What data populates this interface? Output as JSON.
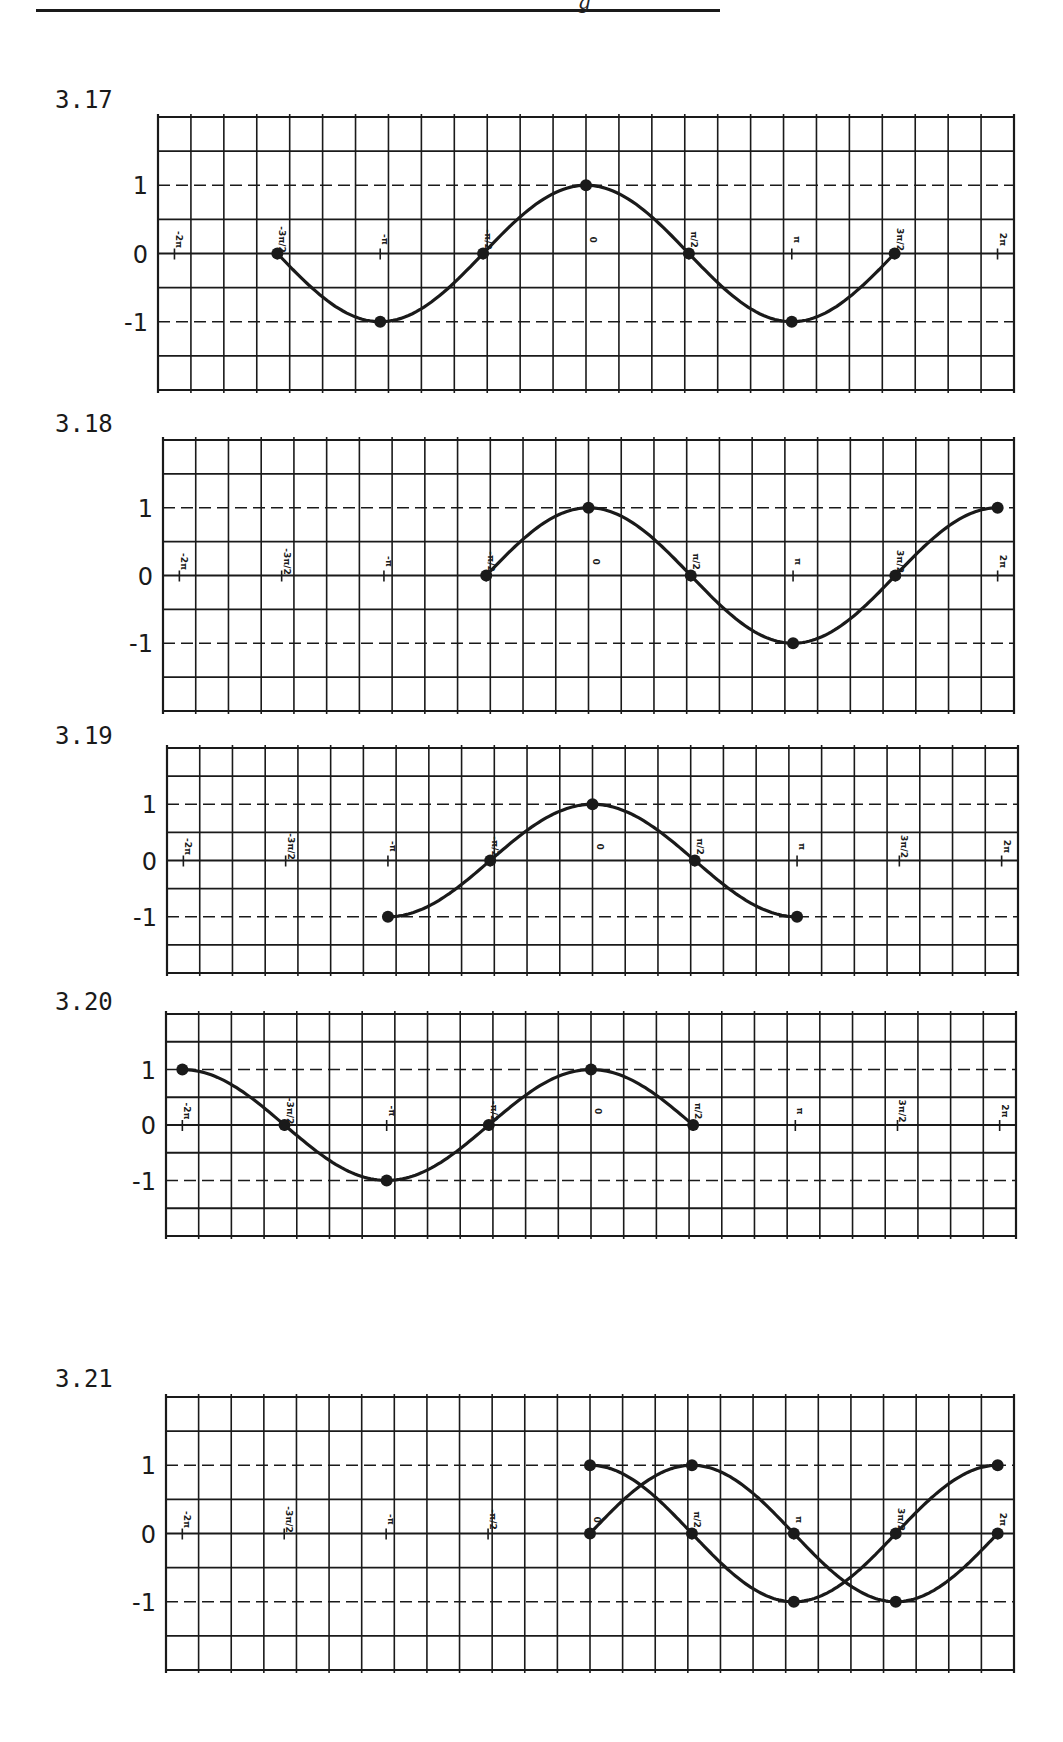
{
  "header": {
    "fragment": "g"
  },
  "x_tick_labels": [
    "-2π",
    "-3π/2",
    "-π",
    "-π/2",
    "0",
    "π/2",
    "π",
    "3π/2",
    "2π"
  ],
  "y_tick_labels": [
    "1",
    "0",
    "-1"
  ],
  "colors": {
    "ink": "#1a1a1a",
    "paper": "#ffffff"
  },
  "figures": [
    {
      "label": "3.17",
      "top": 117,
      "bottom": 390,
      "left": 158,
      "right": 1014,
      "labelTop": 86
    },
    {
      "label": "3.18",
      "top": 440,
      "bottom": 711,
      "left": 163,
      "right": 1014,
      "labelTop": 410
    },
    {
      "label": "3.19",
      "top": 748,
      "bottom": 973,
      "left": 167,
      "right": 1018,
      "labelTop": 722
    },
    {
      "label": "3.20",
      "top": 1014,
      "bottom": 1236,
      "left": 166,
      "right": 1016,
      "labelTop": 988
    },
    {
      "label": "3.21",
      "top": 1397,
      "bottom": 1670,
      "left": 166,
      "right": 1014,
      "labelTop": 1365
    }
  ],
  "chart_data": [
    {
      "type": "line",
      "title": "3.17",
      "function": "y = cos x",
      "xlabel": "",
      "ylabel": "",
      "x_ticks": [
        "-2π",
        "-3π/2",
        "-π",
        "-π/2",
        "0",
        "π/2",
        "π",
        "3π/2",
        "2π"
      ],
      "y_ticks": [
        1,
        0,
        -1
      ],
      "xlim": [
        -6.283,
        6.283
      ],
      "ylim": [
        -1.5,
        1.5
      ],
      "grid": true,
      "series": [
        {
          "name": "cos x",
          "x_range": [
            -4.712,
            4.712
          ],
          "points": [
            [
              "-3π/2",
              0
            ],
            [
              "-π",
              -1
            ],
            [
              "-π/2",
              0
            ],
            [
              "0",
              1
            ],
            [
              "π/2",
              0
            ],
            [
              "π",
              -1
            ],
            [
              "3π/2",
              0
            ]
          ]
        }
      ]
    },
    {
      "type": "line",
      "title": "3.18",
      "function": "y = cos x",
      "x_ticks": [
        "-2π",
        "-3π/2",
        "-π",
        "-π/2",
        "0",
        "π/2",
        "π",
        "3π/2",
        "2π"
      ],
      "y_ticks": [
        1,
        0,
        -1
      ],
      "xlim": [
        -6.283,
        6.283
      ],
      "ylim": [
        -1.5,
        1.5
      ],
      "grid": true,
      "series": [
        {
          "name": "cos x",
          "x_range": [
            -1.571,
            6.283
          ],
          "points": [
            [
              "-π/2",
              0
            ],
            [
              "0",
              1
            ],
            [
              "π/2",
              0
            ],
            [
              "π",
              -1
            ],
            [
              "3π/2",
              0
            ],
            [
              "2π",
              1
            ]
          ]
        }
      ]
    },
    {
      "type": "line",
      "title": "3.19",
      "function": "y = cos x",
      "x_ticks": [
        "-2π",
        "-3π/2",
        "-π",
        "-π/2",
        "0",
        "π/2",
        "π",
        "3π/2",
        "2π"
      ],
      "y_ticks": [
        1,
        0,
        -1
      ],
      "xlim": [
        -6.283,
        6.283
      ],
      "ylim": [
        -1.5,
        1.5
      ],
      "grid": true,
      "series": [
        {
          "name": "cos x",
          "x_range": [
            -3.142,
            3.142
          ],
          "points": [
            [
              "-π",
              -1
            ],
            [
              "-π/2",
              0
            ],
            [
              "0",
              1
            ],
            [
              "π/2",
              0
            ],
            [
              "π",
              -1
            ]
          ]
        }
      ]
    },
    {
      "type": "line",
      "title": "3.20",
      "function": "y = cos x",
      "x_ticks": [
        "-2π",
        "-3π/2",
        "-π",
        "-π/2",
        "0",
        "π/2",
        "π",
        "3π/2",
        "2π"
      ],
      "y_ticks": [
        1,
        0,
        -1
      ],
      "xlim": [
        -6.283,
        6.283
      ],
      "ylim": [
        -1.5,
        1.5
      ],
      "grid": true,
      "series": [
        {
          "name": "cos x",
          "x_range": [
            -6.283,
            1.571
          ],
          "points": [
            [
              "-2π",
              1
            ],
            [
              "-3π/2",
              0
            ],
            [
              "-π",
              -1
            ],
            [
              "-π/2",
              0
            ],
            [
              "0",
              1
            ],
            [
              "π/2",
              0
            ]
          ]
        }
      ]
    },
    {
      "type": "line",
      "title": "3.21",
      "function": "y = sin x and y = cos x",
      "x_ticks": [
        "-2π",
        "-3π/2",
        "-π",
        "-π/2",
        "0",
        "π/2",
        "π",
        "3π/2",
        "2π"
      ],
      "y_ticks": [
        1,
        0,
        -1
      ],
      "xlim": [
        -6.283,
        6.283
      ],
      "ylim": [
        -1.5,
        1.5
      ],
      "grid": true,
      "series": [
        {
          "name": "cos x",
          "x_range": [
            0,
            6.283
          ],
          "points": [
            [
              "0",
              1
            ],
            [
              "π/2",
              0
            ],
            [
              "π",
              -1
            ],
            [
              "3π/2",
              0
            ],
            [
              "2π",
              1
            ]
          ]
        },
        {
          "name": "sin x",
          "x_range": [
            0,
            6.283
          ],
          "points": [
            [
              "0",
              0
            ],
            [
              "π/2",
              1
            ],
            [
              "π",
              0
            ],
            [
              "3π/2",
              -1
            ],
            [
              "2π",
              0
            ]
          ]
        }
      ]
    }
  ]
}
